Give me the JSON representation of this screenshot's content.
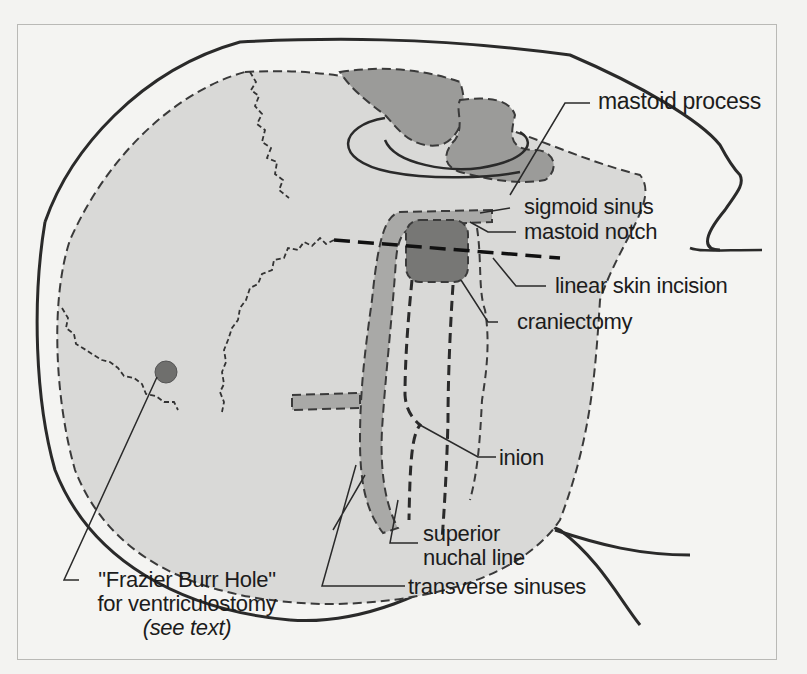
{
  "figure": {
    "type": "posterior-lateral skull diagram",
    "colors": {
      "background": "#f4f4f2",
      "bone_fill": "#d9d9d7",
      "sinus_fill": "#a9a9a7",
      "mastoid_fill": "#8f8f8d",
      "craniectomy_fill": "#777775",
      "outline": "#2a2a2a",
      "label_text": "#1c1c1c"
    },
    "labels": {
      "mastoid_process": "mastoid process",
      "sigmoid_sinus": "sigmoid sinus",
      "mastoid_notch": "mastoid notch",
      "linear_skin_incision": "linear skin incision",
      "craniectomy": "craniectomy",
      "inion": "inion",
      "superior_nuchal_line_1": "superior",
      "superior_nuchal_line_2": "nuchal line",
      "transverse_sinuses": "transverse sinuses",
      "frazier_line1": "\"Frazier Burr Hole\"",
      "frazier_line2": "for ventriculostomy",
      "frazier_line3": "(see text)"
    }
  }
}
